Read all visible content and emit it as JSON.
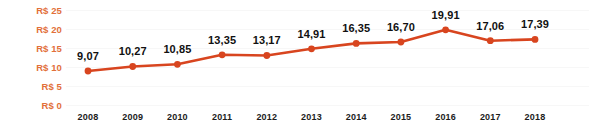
{
  "chart_data": {
    "type": "line",
    "title": "",
    "xlabel": "",
    "ylabel": "",
    "categories": [
      "2008",
      "2009",
      "2010",
      "2011",
      "2012",
      "2013",
      "2014",
      "2015",
      "2016",
      "2017",
      "2018"
    ],
    "values": [
      9.07,
      10.27,
      10.85,
      13.35,
      13.17,
      14.91,
      16.35,
      16.7,
      19.91,
      17.06,
      17.39
    ],
    "value_labels": [
      "9,07",
      "10,27",
      "10,85",
      "13,35",
      "13,17",
      "14,91",
      "16,35",
      "16,70",
      "19,91",
      "17,06",
      "17,39"
    ],
    "ylim": [
      0,
      25
    ],
    "yticks": [
      0,
      5,
      10,
      15,
      20,
      25
    ],
    "ytick_labels": [
      "R$ 0",
      "R$ 5",
      "R$ 10",
      "R$ 15",
      "R$ 20",
      "R$ 25"
    ],
    "grid": true,
    "legend": "none",
    "currency_prefix": "R$",
    "decimal_separator": ",",
    "series": [
      {
        "name": "",
        "values": [
          9.07,
          10.27,
          10.85,
          13.35,
          13.17,
          14.91,
          16.35,
          16.7,
          19.91,
          17.06,
          17.39
        ]
      }
    ],
    "colors": {
      "line": "#D8451F",
      "marker": "#D8451F",
      "ytick_text": "#E2703A",
      "xtick_text": "#1c1c1c",
      "value_label_text": "#111111",
      "gridline": "#F7F7F7",
      "background": "#FFFFFF"
    }
  }
}
